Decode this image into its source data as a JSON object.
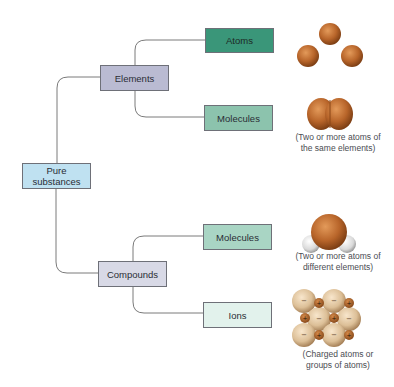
{
  "diagram": {
    "root": {
      "label": "Pure substances"
    },
    "branches": [
      {
        "label": "Elements",
        "children": [
          {
            "label": "Atoms",
            "illustration": "three-separate-atoms",
            "caption": ""
          },
          {
            "label": "Molecules",
            "illustration": "diatomic-same-element",
            "caption_line1": "(Two or more atoms of",
            "caption_line2": "the same elements)"
          }
        ]
      },
      {
        "label": "Compounds",
        "children": [
          {
            "label": "Molecules",
            "illustration": "water-like-molecule",
            "caption_line1": "(Two or more atoms of",
            "caption_line2": "different elements)"
          },
          {
            "label": "Ions",
            "illustration": "ionic-lattice",
            "caption_line1": "(Charged atoms or",
            "caption_line2": "groups of atoms)",
            "charges": {
              "large": "−",
              "small": "+"
            }
          }
        ]
      }
    ]
  },
  "colors": {
    "elements_box": "#babbd2",
    "pure_box": "#bfe1f1",
    "compounds_box": "#d8d9e6",
    "atoms_box": "#3a9679",
    "molecules_elements_box": "#8cc3ad",
    "molecules_compounds_box": "#a9d5c4",
    "ions_box": "#e2f2ec",
    "atom_brown": "#b8652a",
    "hydrogen_white": "#e6e6e6",
    "ion_tan": "#dcbf97"
  }
}
